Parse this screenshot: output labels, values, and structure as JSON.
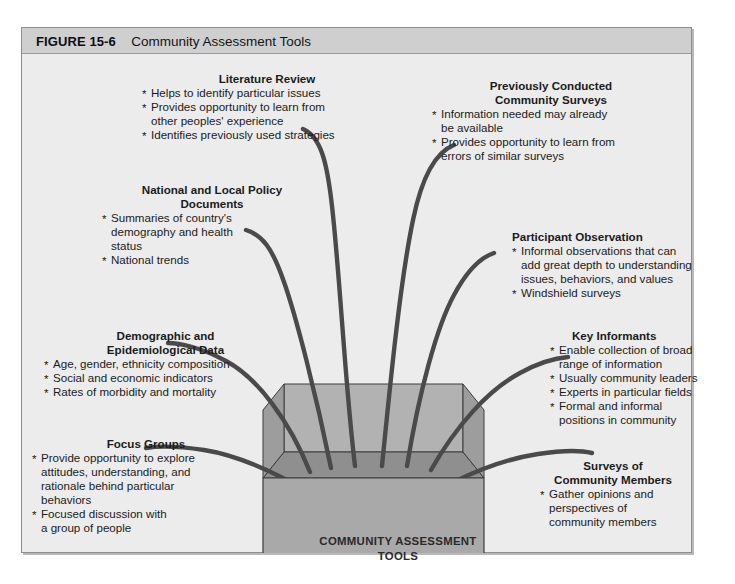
{
  "figure": {
    "label": "FIGURE 15-6",
    "title": "Community Assessment Tools"
  },
  "center_box": {
    "caption_line1": "COMMUNITY ASSESSMENT",
    "caption_line2": "TOOLS",
    "colors": {
      "front_face": "#a9a9a9",
      "inner_back": "#b5b5b5",
      "inner_floor": "#949494",
      "outline": "#3c3c3c"
    }
  },
  "colors": {
    "page_background": "#ffffff",
    "panel_background": "#ececed",
    "caption_bar": "#cfcfd0",
    "curve": "#4a4a4a",
    "text": "#1b1b1b"
  },
  "tools": [
    {
      "id": "literature-review",
      "heading": "Literature Review",
      "bullets": [
        "Helps to identify particular issues",
        "Provides opportunity to learn from\n    other peoples' experience",
        "Identifies previously used strategies"
      ]
    },
    {
      "id": "previously-conducted-community-surveys",
      "heading": "Previously Conducted\nCommunity Surveys",
      "bullets": [
        "Information needed may already\n    be available",
        "Provides opportunity to learn from\n    errors of similar surveys"
      ]
    },
    {
      "id": "national-and-local-policy-documents",
      "heading": "National and Local Policy\nDocuments",
      "bullets": [
        "Summaries of country's\n    demography and health\n    status",
        "National trends"
      ]
    },
    {
      "id": "participant-observation",
      "heading": "Participant Observation",
      "bullets": [
        "Informal observations that can\n    add great depth to understanding\n    issues, behaviors, and values",
        "Windshield surveys"
      ]
    },
    {
      "id": "demographic-and-epidemiological-data",
      "heading": "Demographic and\nEpidemiological Data",
      "bullets": [
        "Age, gender, ethnicity composition",
        "Social and economic indicators",
        "Rates of morbidity and mortality"
      ]
    },
    {
      "id": "key-informants",
      "heading": "Key Informants",
      "bullets": [
        "Enable collection of broad\n    range of information",
        "Usually community leaders",
        "Experts in particular fields",
        "Formal and informal\n    positions in community"
      ]
    },
    {
      "id": "focus-groups",
      "heading": "Focus Groups",
      "bullets": [
        "Provide opportunity to explore\n    attitudes, understanding, and\n    rationale behind particular\n    behaviors",
        "Focused discussion with\n    a group of people"
      ]
    },
    {
      "id": "surveys-of-community-members",
      "heading": "Surveys of\nCommunity Members",
      "bullets": [
        "Gather opinions and\n    perspectives of\n    community members"
      ]
    }
  ]
}
